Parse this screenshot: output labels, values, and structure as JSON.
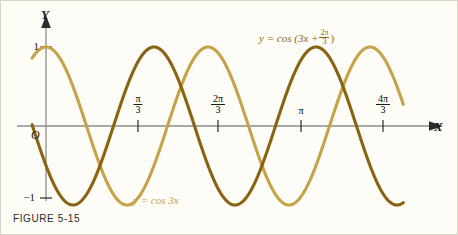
{
  "figure": {
    "caption": "FIGURE 5-15",
    "background_color": "#fdfcf7"
  },
  "axes": {
    "x_letter": "X",
    "y_letter": "Y",
    "origin_label": "O",
    "y_ticks": [
      {
        "label": "1",
        "value": 1
      },
      {
        "label": "−1",
        "value": -1
      }
    ],
    "x_ticks": [
      {
        "label": "π/3",
        "numerator": "π",
        "denominator": "3",
        "stacked": true,
        "value": 1.0472
      },
      {
        "label": "2π/3",
        "numerator": "2π",
        "denominator": "3",
        "stacked": true,
        "value": 2.0944
      },
      {
        "label": "π",
        "numerator": "π",
        "denominator": "",
        "stacked": false,
        "value": 3.1416
      },
      {
        "label": "4π/3",
        "numerator": "4π",
        "denominator": "3",
        "stacked": true,
        "value": 4.1888
      }
    ]
  },
  "curves": [
    {
      "name": "cos-3x",
      "label_prefix": "y = cos 3x",
      "color": "#c6a249",
      "amplitude": 1,
      "frequency": 3,
      "phase": 0
    },
    {
      "name": "cos-3x-plus-2pi-over-3",
      "label_head": "y = cos (3x +",
      "label_num": "2π",
      "label_den": "3",
      "label_tail": ")",
      "color": "#8a6312",
      "amplitude": 1,
      "frequency": 3,
      "phase": 2.0944
    }
  ],
  "chart_data": {
    "type": "line",
    "title": "",
    "xlabel": "X",
    "ylabel": "Y",
    "xlim": [
      -0.18,
      4.62
    ],
    "ylim": [
      -1.28,
      1.28
    ],
    "grid": false,
    "legend": "inline-curve-labels",
    "x_tick_values": [
      1.0472,
      2.0944,
      3.1416,
      4.1888
    ],
    "x_tick_labels": [
      "π/3",
      "2π/3",
      "π",
      "4π/3"
    ],
    "y_tick_values": [
      1,
      -1
    ],
    "y_tick_labels": [
      "1",
      "−1"
    ],
    "series": [
      {
        "name": "y = cos 3x",
        "color": "#c6a249",
        "formula": "cos(3x)",
        "amplitude": 1,
        "angular_frequency": 3,
        "phase_shift": 0,
        "period": 2.0944,
        "maxima_x": [
          0,
          2.0944,
          4.1888
        ],
        "minima_x": [
          1.0472,
          3.1416
        ],
        "zeros_x": [
          0.5236,
          1.5708,
          2.618,
          3.6652
        ],
        "y_at_x0": 1
      },
      {
        "name": "y = cos (3x + 2π/3)",
        "color": "#8a6312",
        "formula": "cos(3x + 2π/3)",
        "amplitude": 1,
        "angular_frequency": 3,
        "phase_shift": 2.0944,
        "horizontal_shift": -0.6981,
        "period": 2.0944,
        "maxima_x": [
          0.6981,
          2.7925,
          4.8869
        ],
        "minima_x": [
          -0.3491,
          1.7453,
          3.8397
        ],
        "zeros_x": [
          0.1745,
          1.2217,
          2.2689,
          3.3161,
          4.3633
        ],
        "y_at_x0": -0.5
      }
    ]
  }
}
